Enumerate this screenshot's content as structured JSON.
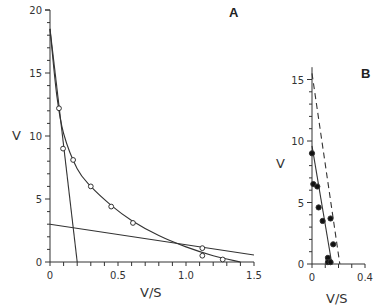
{
  "chart_data": [
    {
      "panel": "A",
      "type": "scatter",
      "xlabel": "V/S",
      "ylabel": "V",
      "xlim": [
        0,
        1.5
      ],
      "ylim": [
        0,
        20
      ],
      "xticks": [
        "0",
        "0.5",
        "1.0",
        "1.5"
      ],
      "yticks": [
        "0",
        "5",
        "10",
        "15",
        "20"
      ],
      "grid": false,
      "series": [
        {
          "name": "data (open circles)",
          "marker": "open-circle",
          "x": [
            0.066,
            0.096,
            0.17,
            0.3,
            0.45,
            0.61,
            1.12,
            1.12,
            1.27
          ],
          "y": [
            12.2,
            9.0,
            8.1,
            6.0,
            4.4,
            3.1,
            1.1,
            0.5,
            0.2
          ]
        },
        {
          "name": "fitted curve",
          "style": "solid-curve",
          "x": [
            0.0,
            0.05,
            0.1,
            0.2,
            0.3,
            0.45,
            0.6,
            0.8,
            1.0,
            1.2,
            1.4
          ],
          "y": [
            18.5,
            13.2,
            10.2,
            7.4,
            6.0,
            4.5,
            3.3,
            2.1,
            1.2,
            0.5,
            0.0
          ]
        },
        {
          "name": "high-affinity component",
          "style": "solid-line",
          "x": [
            0.0,
            0.2
          ],
          "y": [
            18.5,
            0
          ]
        },
        {
          "name": "low-affinity component",
          "style": "solid-line",
          "x": [
            0.0,
            1.5
          ],
          "y": [
            3.0,
            0.55
          ]
        }
      ]
    },
    {
      "panel": "B",
      "type": "scatter",
      "xlabel": "V/S",
      "ylabel": "V",
      "xlim": [
        0,
        0.4
      ],
      "ylim": [
        0,
        16
      ],
      "xticks": [
        "0",
        "0.4"
      ],
      "yticks": [
        "0",
        "5",
        "10",
        "15"
      ],
      "grid": false,
      "series": [
        {
          "name": "data (filled circles)",
          "marker": "filled-circle",
          "x": [
            0.0,
            0.01,
            0.04,
            0.05,
            0.08,
            0.14,
            0.16,
            0.12,
            0.12,
            0.14
          ],
          "y": [
            9.0,
            6.5,
            6.3,
            4.6,
            3.5,
            3.7,
            1.6,
            0.5,
            0.15,
            0.15
          ]
        },
        {
          "name": "fitted line",
          "style": "solid-line",
          "x": [
            0.0,
            0.15
          ],
          "y": [
            9.6,
            0
          ]
        },
        {
          "name": "reference line",
          "style": "dashed-line",
          "x": [
            0.0,
            0.21
          ],
          "y": [
            15.5,
            0
          ]
        }
      ]
    }
  ],
  "labels": {
    "panel_a": "A",
    "panel_b": "B",
    "a_xlabel": "V/S",
    "a_ylabel": "V",
    "b_xlabel": "V/S",
    "b_ylabel": "V",
    "a_xticks": [
      "0",
      "0.5",
      "1.0",
      "1.5"
    ],
    "a_yticks": [
      "0",
      "5",
      "10",
      "15",
      "20"
    ],
    "b_xticks": [
      "0",
      "0.4"
    ],
    "b_yticks": [
      "0",
      "5",
      "10",
      "15"
    ]
  }
}
